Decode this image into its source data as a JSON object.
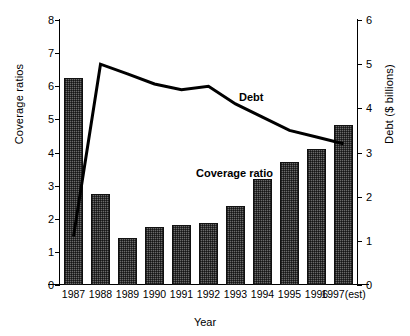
{
  "chart_data": {
    "type": "bar",
    "title": "",
    "xlabel": "Year",
    "ylabel": "Coverage  ratios",
    "y2label": "Debt ($ billions)",
    "categories": [
      "1987",
      "1988",
      "1989",
      "1990",
      "1991",
      "1992",
      "1993",
      "1994",
      "1995",
      "1996",
      "1997(est)"
    ],
    "ylim": [
      0,
      8
    ],
    "y2lim": [
      0,
      6
    ],
    "yticks": [
      "0",
      "1",
      "2",
      "3",
      "4",
      "5",
      "6",
      "7",
      "8"
    ],
    "y2ticks": [
      "0",
      "1",
      "2",
      "3",
      "4",
      "5",
      "6"
    ],
    "grid": false,
    "legend_position": "inline-annotation",
    "series": [
      {
        "name": "Coverage ratio",
        "type": "bar",
        "axis": "left",
        "values": [
          6.24,
          2.76,
          1.43,
          1.76,
          1.82,
          1.88,
          2.4,
          3.2,
          3.7,
          4.1,
          4.82
        ]
      },
      {
        "name": "Debt",
        "type": "line",
        "axis": "right",
        "values": [
          1.1,
          5.0,
          4.78,
          4.55,
          4.42,
          4.5,
          4.1,
          3.8,
          3.5,
          3.35,
          3.2
        ]
      }
    ],
    "annotations": [
      {
        "label": "Debt",
        "series": "Debt"
      },
      {
        "label": "Coverage ratio",
        "series": "Coverage ratio"
      }
    ],
    "colors": {
      "bar_fill": "#6a6a6a",
      "bar_edge": "#111111",
      "line": "#000000",
      "axis": "#000000",
      "background": "#ffffff"
    }
  }
}
